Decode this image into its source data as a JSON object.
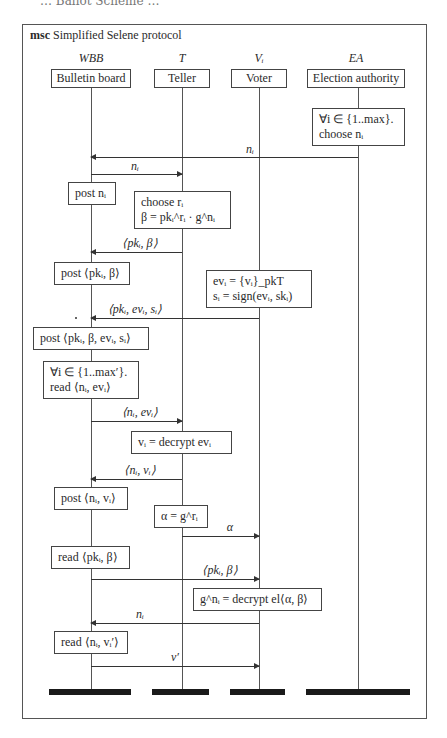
{
  "diagram": {
    "cut_text": "… Ballot Scheme …",
    "title_keyword": "msc",
    "title": "Simplified Selene protocol",
    "instances": [
      {
        "id": "WBB",
        "name": "WBB",
        "label": "Bulletin board"
      },
      {
        "id": "T",
        "name": "T",
        "label": "Teller"
      },
      {
        "id": "Vi",
        "name": "Vᵢ",
        "label": "Voter"
      },
      {
        "id": "EA",
        "name": "EA",
        "label": "Election authority"
      }
    ],
    "actions": [
      {
        "instance": "EA",
        "lines": [
          "∀i ∈ {1..max}.",
          "choose nᵢ"
        ]
      },
      {
        "instance": "WBB",
        "lines": [
          "post nᵢ"
        ]
      },
      {
        "instance": "T",
        "lines": [
          "choose rᵢ",
          "β = pkᵢ^rᵢ · g^nᵢ"
        ]
      },
      {
        "instance": "WBB",
        "lines": [
          "post ⟨pkᵢ, β⟩"
        ]
      },
      {
        "instance": "Vi",
        "lines": [
          "evᵢ = {vᵢ}_pkT",
          "sᵢ = sign(evᵢ, skᵢ)"
        ]
      },
      {
        "instance": "WBB",
        "lines": [
          "post ⟨pkᵢ, β, evᵢ, sᵢ⟩"
        ]
      },
      {
        "instance": "WBB",
        "lines": [
          "∀i ∈ {1..max′}.",
          "read ⟨nᵢ, evᵢ⟩"
        ]
      },
      {
        "instance": "T",
        "lines": [
          "vᵢ = decrypt evᵢ"
        ]
      },
      {
        "instance": "WBB",
        "lines": [
          "post ⟨nᵢ, vᵢ⟩"
        ]
      },
      {
        "instance": "T",
        "lines": [
          "α = g^rᵢ"
        ]
      },
      {
        "instance": "WBB",
        "lines": [
          "read ⟨pkᵢ, β⟩"
        ]
      },
      {
        "instance": "Vi",
        "lines": [
          "g^nᵢ = decrypt el⟨α, β⟩"
        ]
      },
      {
        "instance": "WBB",
        "lines": [
          "read ⟨nᵢ, vᵢ′⟩"
        ]
      }
    ],
    "messages": [
      {
        "from": "EA",
        "to": "WBB",
        "label": "nᵢ"
      },
      {
        "from": "WBB",
        "to": "T",
        "label": "nᵢ"
      },
      {
        "from": "T",
        "to": "WBB",
        "label": "⟨pkᵢ, β⟩"
      },
      {
        "from": "Vi",
        "to": "WBB",
        "label": "⟨pkᵢ, evᵢ, sᵢ⟩"
      },
      {
        "from": "WBB",
        "to": "T",
        "label": "⟨nᵢ, evᵢ⟩"
      },
      {
        "from": "T",
        "to": "WBB",
        "label": "⟨nᵢ, vᵢ⟩"
      },
      {
        "from": "T",
        "to": "Vi",
        "label": "α"
      },
      {
        "from": "WBB",
        "to": "Vi",
        "label": "⟨pkᵢ, β⟩"
      },
      {
        "from": "Vi",
        "to": "WBB",
        "label": "nᵢ"
      },
      {
        "from": "WBB",
        "to": "Vi",
        "label": "v′"
      }
    ]
  }
}
